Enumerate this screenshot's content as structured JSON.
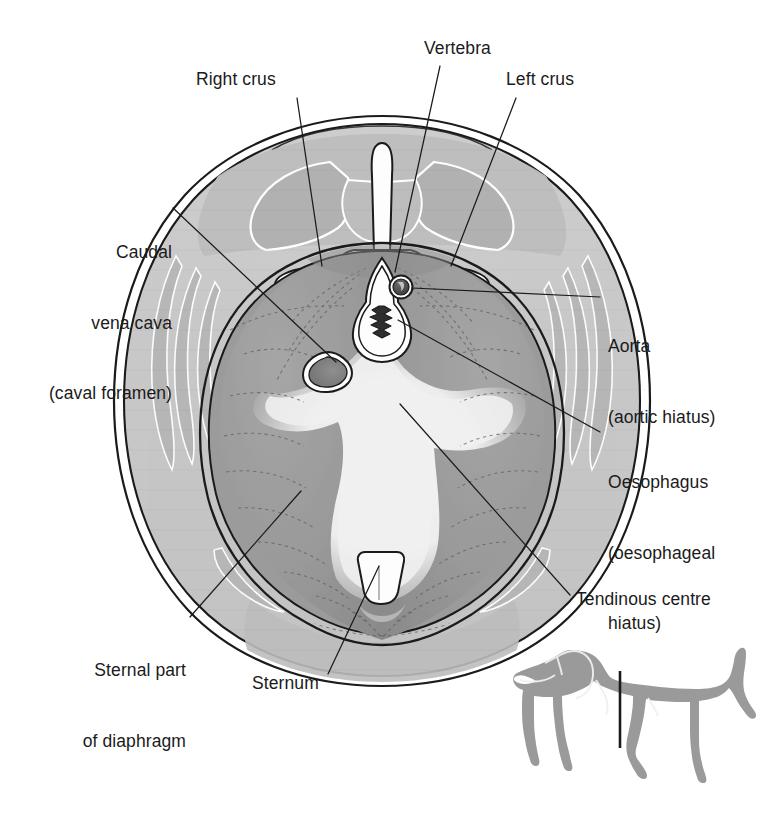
{
  "figure": {
    "species_inset": "dog-silhouette-with-section-plane"
  },
  "labels": [
    {
      "id": "right-crus",
      "text": "Right crus",
      "lines": [
        "Right crus"
      ],
      "align": "left",
      "x": 196,
      "y": 68,
      "leader": [
        [
          295,
          96
        ],
        [
          322,
          268
        ]
      ]
    },
    {
      "id": "vertebra",
      "text": "Vertebra",
      "lines": [
        "Vertebra"
      ],
      "align": "left",
      "x": 424,
      "y": 37,
      "leader": [
        [
          438,
          65
        ],
        [
          396,
          272
        ]
      ]
    },
    {
      "id": "left-crus",
      "text": "Left crus",
      "lines": [
        "Left crus"
      ],
      "align": "left",
      "x": 506,
      "y": 68,
      "leader": [
        [
          517,
          96
        ],
        [
          452,
          268
        ]
      ]
    },
    {
      "id": "caudal-vena-cava",
      "text": "Caudal vena cava (caval foramen)",
      "lines": [
        "Caudal",
        "vena cava",
        "(caval foramen)"
      ],
      "align": "right",
      "x": 44,
      "y": 194,
      "leader": [
        [
          172,
          207
        ],
        [
          337,
          363
        ]
      ]
    },
    {
      "id": "aorta",
      "text": "Aorta (aortic hiatus)",
      "lines": [
        "Aorta",
        "(aortic hiatus)"
      ],
      "align": "left",
      "x": 608,
      "y": 288,
      "leader": [
        [
          601,
          298
        ],
        [
          402,
          287
        ]
      ]
    },
    {
      "id": "oesophagus",
      "text": "Oesophagus (oesophageal hiatus)",
      "lines": [
        "Oesophagus",
        "(oesophageal",
        "hiatus)"
      ],
      "align": "left",
      "x": 608,
      "y": 424,
      "leader": [
        [
          601,
          432
        ],
        [
          398,
          318
        ]
      ]
    },
    {
      "id": "tendinous-centre",
      "text": "Tendinous centre",
      "lines": [
        "Tendinous centre"
      ],
      "align": "left",
      "x": 576,
      "y": 588,
      "leader": [
        [
          570,
          596
        ],
        [
          400,
          402
        ]
      ]
    },
    {
      "id": "sternal-part",
      "text": "Sternal part of diaphragm",
      "lines": [
        "Sternal part",
        "of diaphragm"
      ],
      "align": "right",
      "x": 84,
      "y": 612,
      "leader": [
        [
          190,
          618
        ],
        [
          300,
          492
        ]
      ]
    },
    {
      "id": "sternum",
      "text": "Sternum",
      "lines": [
        "Sternum"
      ],
      "align": "left",
      "x": 252,
      "y": 672,
      "leader": [
        [
          325,
          676
        ],
        [
          378,
          565
        ]
      ]
    }
  ],
  "colors": {
    "ink": "#1b1b1b",
    "body_wall": "#c9c9c9",
    "body_wall_deep": "#bdbdbd",
    "muscle_shadow": "#b0b0b0",
    "diaphragm_muscle": "#9b9b9b",
    "diaphragm_muscle_dark": "#8d8d8d",
    "tendinous_centre": "#efefef",
    "bone_white": "#fdfdfd",
    "aorta_dark": "#4a4a4a",
    "dog_silhouette": "#9a9a9a",
    "page_background": "#ffffff"
  },
  "structures": [
    {
      "name": "body-wall-outline",
      "kind": "outline"
    },
    {
      "name": "vertebra",
      "kind": "bone"
    },
    {
      "name": "spinous-process",
      "kind": "bone"
    },
    {
      "name": "transverse-process-left",
      "kind": "bone"
    },
    {
      "name": "transverse-process-right",
      "kind": "bone"
    },
    {
      "name": "spinal-canal",
      "kind": "canal"
    },
    {
      "name": "right-crus",
      "kind": "muscle"
    },
    {
      "name": "left-crus",
      "kind": "muscle"
    },
    {
      "name": "tendinous-centre",
      "kind": "tendon"
    },
    {
      "name": "aorta",
      "kind": "vessel"
    },
    {
      "name": "oesophagus",
      "kind": "viscus"
    },
    {
      "name": "caval-foramen",
      "kind": "foramen"
    },
    {
      "name": "sternum",
      "kind": "bone"
    },
    {
      "name": "sternal-part-of-diaphragm",
      "kind": "muscle"
    },
    {
      "name": "ribs",
      "kind": "bone"
    }
  ]
}
